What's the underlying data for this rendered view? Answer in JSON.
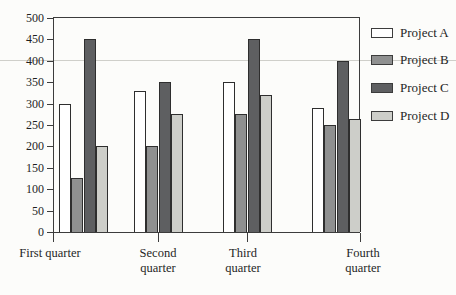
{
  "figure": {
    "background": "#fcfcfa",
    "text_color": "#1f1f1f",
    "axis_color": "#3c3c3c"
  },
  "chart_data": {
    "type": "bar",
    "title": "",
    "xlabel": "",
    "ylabel": "",
    "categories": [
      "First quarter",
      "Second quarter",
      "Third quarter",
      "Fourth quarter"
    ],
    "series": [
      {
        "name": "Project A",
        "color": "#ffffff",
        "values": [
          300,
          330,
          350,
          290
        ]
      },
      {
        "name": "Project B",
        "color": "#8f9090",
        "values": [
          125,
          200,
          275,
          250
        ]
      },
      {
        "name": "Project C",
        "color": "#5e5f61",
        "values": [
          450,
          350,
          450,
          400
        ]
      },
      {
        "name": "Project D",
        "color": "#cdcec9",
        "values": [
          200,
          275,
          320,
          265
        ]
      }
    ],
    "ylim": [
      0,
      500
    ],
    "yticks": [
      0,
      50,
      100,
      150,
      200,
      250,
      300,
      350,
      400,
      450,
      500
    ],
    "grid": false,
    "faint_gridline_at": 400,
    "legend_position": "right",
    "legend_labels": [
      "Project A",
      "Project B",
      "Project C",
      "Project D"
    ]
  }
}
